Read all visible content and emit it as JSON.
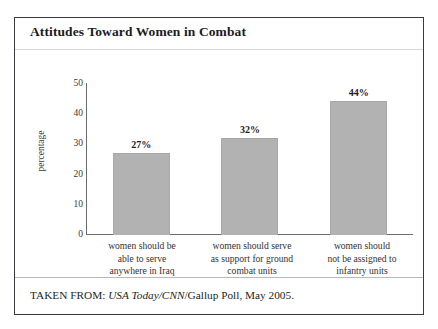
{
  "figure": {
    "title": "Attitudes Toward Women in Combat",
    "source_prefix": "TAKEN FROM: ",
    "source_italic": "USA Today/CNN",
    "source_suffix": "/Gallup Poll, May 2005.",
    "frame_color": "#3b3b3f",
    "bar_color": "#b2b2b2",
    "axis_color": "#6b6b6b",
    "text_color": "#231f20"
  },
  "chart_data": {
    "type": "bar",
    "title": "Attitudes Toward Women in Combat",
    "xlabel": "",
    "ylabel": "percentage",
    "ylim": [
      0,
      50
    ],
    "yticks": [
      "0",
      "10",
      "20",
      "30",
      "40",
      "50"
    ],
    "ytick_values": [
      0,
      10,
      20,
      30,
      40,
      50
    ],
    "grid": false,
    "legend": "none",
    "categories": [
      "women should be able to serve anywhere in Iraq",
      "women should serve as support for ground combat units",
      "women should not be assigned to infantry units"
    ],
    "category_lines": [
      [
        "women should be",
        "able to serve",
        "anywhere in Iraq"
      ],
      [
        "women should serve",
        "as support for ground",
        "combat units"
      ],
      [
        "women should",
        "not be assigned to",
        "infantry units"
      ]
    ],
    "values": [
      27,
      32,
      44
    ],
    "value_labels": [
      "27%",
      "32%",
      "44%"
    ],
    "source": "TAKEN FROM: USA Today/CNN/Gallup Poll, May 2005."
  }
}
